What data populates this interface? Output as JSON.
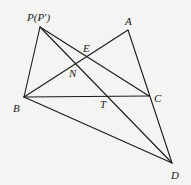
{
  "diagram": {
    "type": "geometry-figure",
    "stroke_color": "#1a1a1a",
    "background": "#f4f4f2",
    "points": {
      "P": {
        "x": 40,
        "y": 27,
        "label": "P(P′)",
        "lx": 27,
        "ly": 21
      },
      "A": {
        "x": 128,
        "y": 30,
        "label": "A",
        "lx": 125,
        "ly": 25
      },
      "B": {
        "x": 24,
        "y": 97,
        "label": "B",
        "lx": 13,
        "ly": 112
      },
      "C": {
        "x": 149,
        "y": 96,
        "label": "C",
        "lx": 154,
        "ly": 102
      },
      "D": {
        "x": 172,
        "y": 163,
        "label": "D",
        "lx": 171,
        "ly": 179
      },
      "E": {
        "x": 86,
        "y": 57,
        "label": "E",
        "lx": 83,
        "ly": 52
      },
      "N": {
        "x": 76,
        "y": 62,
        "label": "N",
        "lx": 69,
        "ly": 77
      },
      "T": {
        "x": 109,
        "y": 96,
        "label": "T",
        "lx": 100,
        "ly": 108
      }
    },
    "segments": [
      [
        "P",
        "B"
      ],
      [
        "P",
        "C"
      ],
      [
        "P",
        "D"
      ],
      [
        "A",
        "B"
      ],
      [
        "A",
        "D"
      ],
      [
        "B",
        "C"
      ],
      [
        "B",
        "D"
      ]
    ]
  }
}
